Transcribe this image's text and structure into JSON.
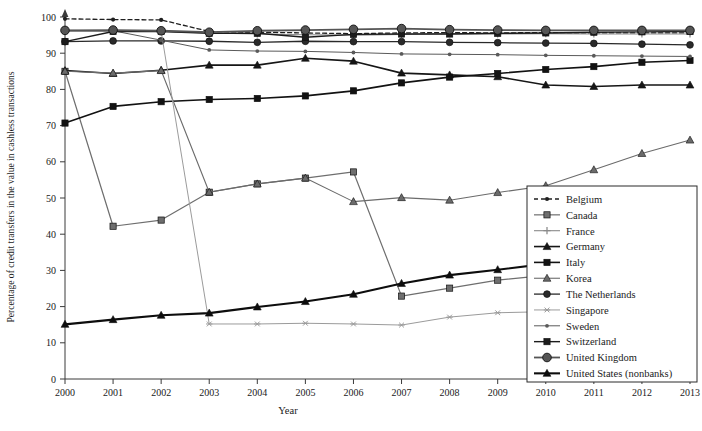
{
  "chart_data": {
    "type": "line",
    "title": "",
    "xlabel": "Year",
    "ylabel": "Percentage of credit transfers in the value in cashless transactions",
    "x": [
      2000,
      2001,
      2002,
      2003,
      2004,
      2005,
      2006,
      2007,
      2008,
      2009,
      2010,
      2011,
      2012,
      2013
    ],
    "xlim": [
      2000,
      2013
    ],
    "ylim": [
      0,
      100
    ],
    "yticks": [
      0,
      10,
      20,
      30,
      40,
      50,
      60,
      70,
      80,
      90,
      100
    ],
    "xticks": [
      "2000",
      "2001",
      "2002",
      "2003",
      "2004",
      "2005",
      "2006",
      "2007",
      "2008",
      "2009",
      "2010",
      "2011",
      "2012",
      "2013"
    ],
    "grid": false,
    "legend_position": "right",
    "series": [
      {
        "name": "Belgium",
        "marker": "circle-small",
        "color": "#1f1f1f",
        "dash": "4,3",
        "width": 1.3,
        "values": [
          99.5,
          99.3,
          99.2,
          96.0,
          95.8,
          95.6,
          95.4,
          95.6,
          95.7,
          95.6,
          95.7,
          95.6,
          95.6,
          95.6
        ]
      },
      {
        "name": "Canada",
        "marker": "square",
        "color": "#6e6e6e",
        "dash": "",
        "width": 1.2,
        "values": [
          85.0,
          42.2,
          43.9,
          51.6,
          53.9,
          55.5,
          57.2,
          22.9,
          25.1,
          27.3,
          28.6,
          30.3,
          32.2,
          33.6
        ]
      },
      {
        "name": "France",
        "marker": "plus",
        "color": "#8a8a8a",
        "dash": "",
        "width": 1.1,
        "values": [
          96.0,
          96.1,
          96.0,
          95.6,
          95.3,
          95.1,
          95.0,
          95.2,
          95.4,
          95.3,
          95.4,
          95.3,
          95.3,
          95.3
        ]
      },
      {
        "name": "Germany",
        "marker": "triangle",
        "color": "#161616",
        "dash": "",
        "width": 1.6,
        "values": [
          85.2,
          84.4,
          85.3,
          86.7,
          86.7,
          88.6,
          87.8,
          84.5,
          84.0,
          83.5,
          81.2,
          80.8,
          81.2,
          81.2
        ]
      },
      {
        "name": "Italy",
        "marker": "square",
        "color": "#121212",
        "dash": "",
        "width": 1.6,
        "values": [
          70.7,
          75.3,
          76.6,
          77.2,
          77.5,
          78.2,
          79.6,
          81.8,
          83.4,
          84.4,
          85.5,
          86.3,
          87.5,
          88.0
        ]
      },
      {
        "name": "Korea",
        "marker": "triangle",
        "color": "#6b6b6b",
        "dash": "",
        "width": 1.1,
        "values": [
          85.0,
          84.5,
          85.2,
          51.6,
          53.9,
          55.5,
          49.0,
          50.1,
          49.4,
          51.5,
          53.4,
          57.8,
          62.3,
          66.0
        ]
      },
      {
        "name": "The Netherlands",
        "marker": "circle",
        "color": "#2a2a2a",
        "dash": "",
        "width": 1.3,
        "values": [
          93.2,
          93.4,
          93.4,
          93.3,
          93.0,
          93.3,
          93.2,
          93.2,
          93.0,
          92.9,
          92.8,
          92.7,
          92.5,
          92.3
        ]
      },
      {
        "name": "Singapore",
        "marker": "star",
        "color": "#9b9b9b",
        "dash": "",
        "width": 1.0,
        "values": [
          96.0,
          96.1,
          96.0,
          15.2,
          15.2,
          15.4,
          15.2,
          14.9,
          17.1,
          18.3,
          18.6,
          19.4,
          20.2,
          20.6
        ]
      },
      {
        "name": "Sweden",
        "marker": "dot",
        "color": "#5a5a5a",
        "dash": "",
        "width": 1.0,
        "values": [
          96.3,
          96.2,
          93.6,
          90.9,
          90.6,
          90.5,
          90.2,
          89.8,
          89.7,
          89.6,
          89.4,
          89.3,
          89.2,
          89.1
        ]
      },
      {
        "name": "Switzerland",
        "marker": "square",
        "color": "#1c1c1c",
        "dash": "",
        "width": 1.4,
        "values": [
          93.2,
          96.0,
          96.0,
          95.5,
          95.5,
          94.4,
          95.2,
          95.3,
          95.3,
          95.5,
          95.6,
          95.8,
          95.9,
          96.0
        ]
      },
      {
        "name": "United Kingdom",
        "marker": "circle-large",
        "color": "#555555",
        "dash": "",
        "width": 1.8,
        "values": [
          96.3,
          96.4,
          96.2,
          95.8,
          96.2,
          96.4,
          96.6,
          96.8,
          96.5,
          96.4,
          96.3,
          96.3,
          96.3,
          96.3
        ]
      },
      {
        "name": "United States (nonbanks)",
        "marker": "triangle",
        "color": "#0d0d0d",
        "dash": "",
        "width": 2.1,
        "values": [
          15.1,
          16.4,
          17.6,
          18.2,
          19.9,
          21.4,
          23.4,
          26.4,
          28.7,
          30.2,
          31.8,
          34.2,
          36.5,
          36.5
        ]
      }
    ]
  },
  "axis": {
    "x_title": "Year",
    "y_title": "Percentage of credit transfers in the value in cashless transactions"
  }
}
